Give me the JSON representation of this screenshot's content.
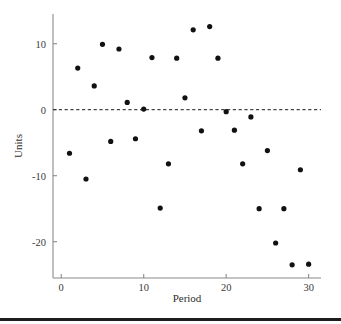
{
  "chart_data": {
    "type": "scatter",
    "title": "",
    "subtitle": "",
    "xlabel": "Period",
    "ylabel": "Units",
    "xlim": [
      -1,
      31.5
    ],
    "ylim": [
      -25.5,
      14.5
    ],
    "xticks": [
      0,
      10,
      20,
      30
    ],
    "xticklabels": [
      "0",
      "10",
      "20",
      "30"
    ],
    "yticks": [
      10,
      0,
      -10,
      -20
    ],
    "yticklabels": [
      "10",
      "0",
      "-10",
      "-20"
    ],
    "grid": false,
    "legend": null,
    "annotations": [
      {
        "name": "zero-reference-line",
        "type": "hline",
        "y": 0,
        "style": "dashed",
        "color": "#1a1a1a"
      }
    ],
    "marker": {
      "shape": "circle",
      "size": 2.6,
      "color": "#111111"
    },
    "series": [
      {
        "name": "Units by Period",
        "color": "#111111",
        "points": [
          {
            "x": 1,
            "y": -6.6
          },
          {
            "x": 2,
            "y": 6.3
          },
          {
            "x": 3,
            "y": -10.5
          },
          {
            "x": 4,
            "y": 3.6
          },
          {
            "x": 5,
            "y": 9.9
          },
          {
            "x": 6,
            "y": -4.8
          },
          {
            "x": 7,
            "y": 9.2
          },
          {
            "x": 8,
            "y": 1.1
          },
          {
            "x": 9,
            "y": -4.4
          },
          {
            "x": 10,
            "y": 0.1
          },
          {
            "x": 11,
            "y": 7.9
          },
          {
            "x": 12,
            "y": -14.9
          },
          {
            "x": 13,
            "y": -8.2
          },
          {
            "x": 14,
            "y": 7.8
          },
          {
            "x": 15,
            "y": 1.8
          },
          {
            "x": 16,
            "y": 12.1
          },
          {
            "x": 17,
            "y": -3.2
          },
          {
            "x": 18,
            "y": 12.6
          },
          {
            "x": 19,
            "y": 7.8
          },
          {
            "x": 20,
            "y": -0.3
          },
          {
            "x": 21,
            "y": -3.1
          },
          {
            "x": 22,
            "y": -8.2
          },
          {
            "x": 23,
            "y": -1.1
          },
          {
            "x": 24,
            "y": -15.0
          },
          {
            "x": 25,
            "y": -6.2
          },
          {
            "x": 26,
            "y": -20.2
          },
          {
            "x": 27,
            "y": -15.0
          },
          {
            "x": 28,
            "y": -23.5
          },
          {
            "x": 29,
            "y": -9.1
          },
          {
            "x": 30,
            "y": -23.4
          }
        ]
      }
    ]
  }
}
